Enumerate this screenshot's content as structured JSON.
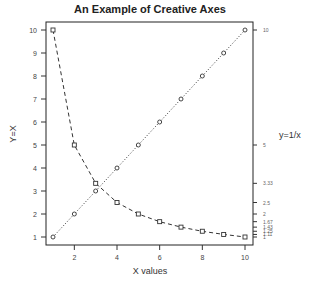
{
  "chart_data": {
    "type": "line",
    "title": "An Example of Creative Axes",
    "xlabel": "X values",
    "ylabel": "Y=X",
    "ylabel_right": "y=1/x",
    "x": [
      1,
      2,
      3,
      4,
      5,
      6,
      7,
      8,
      9,
      10
    ],
    "xlim": [
      1,
      10
    ],
    "ylim": [
      1,
      10
    ],
    "grid": false,
    "x_ticks": [
      2,
      4,
      6,
      8,
      10
    ],
    "y_ticks_left": [
      1,
      2,
      3,
      4,
      5,
      6,
      7,
      8,
      9,
      10
    ],
    "y_ticks_right": [
      {
        "value": 10,
        "label": "10"
      },
      {
        "value": 5,
        "label": "5"
      },
      {
        "value": 3.333,
        "label": "3.33"
      },
      {
        "value": 2.5,
        "label": "2.5"
      },
      {
        "value": 2,
        "label": "2"
      },
      {
        "value": 1.667,
        "label": "1.67"
      },
      {
        "value": 1.429,
        "label": "1.43"
      },
      {
        "value": 1.25,
        "label": "1.25"
      },
      {
        "value": 1.111,
        "label": "1.11"
      },
      {
        "value": 1,
        "label": "1"
      }
    ],
    "series": [
      {
        "name": "y=x",
        "marker": "circle",
        "linestyle": "dotted",
        "values": [
          1,
          2,
          3,
          4,
          5,
          6,
          7,
          8,
          9,
          10
        ]
      },
      {
        "name": "y=1/x",
        "marker": "square",
        "linestyle": "dashed",
        "values": [
          10,
          5,
          3.333,
          2.5,
          2,
          1.667,
          1.429,
          1.25,
          1.111,
          1
        ],
        "plotted_scale": "y*10 (values drawn as 10/x on left axis)"
      }
    ]
  }
}
